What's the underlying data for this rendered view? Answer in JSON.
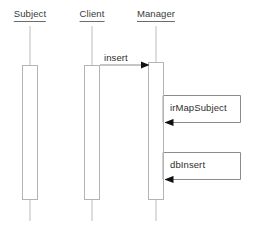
{
  "diagram": {
    "kind": "uml-sequence-diagram",
    "width": 254,
    "height": 228,
    "background_color": "#ffffff",
    "lifeline_color": "#b8b8b8",
    "activation_fill": "#ffffff",
    "activation_stroke": "#b0b0b0",
    "arrow_color": "#6e6e6e",
    "arrowhead_color": "#111111",
    "text_color": "#3a3a3a",
    "participants": [
      {
        "id": "subject",
        "label": "Subject",
        "x": 30,
        "label_y": 12,
        "lifeline_top": 26,
        "lifeline_bottom": 221,
        "activation": {
          "x": 22,
          "y": 65,
          "width": 16,
          "height": 135
        }
      },
      {
        "id": "client",
        "label": "Client",
        "x": 92,
        "label_y": 12,
        "lifeline_top": 26,
        "lifeline_bottom": 221,
        "activation": {
          "x": 84,
          "y": 65,
          "width": 16,
          "height": 135
        }
      },
      {
        "id": "manager",
        "label": "Manager",
        "x": 156,
        "label_y": 12,
        "lifeline_top": 26,
        "lifeline_bottom": 221,
        "activation": {
          "x": 148,
          "y": 62,
          "width": 16,
          "height": 138
        }
      }
    ],
    "messages": [
      {
        "id": "insert",
        "label": "insert",
        "type": "call",
        "from": "client",
        "to": "manager",
        "x1": 100,
        "x2": 150,
        "y": 65,
        "label_x": 104,
        "label_y": 53
      },
      {
        "id": "irMapSubject",
        "label": "irMapSubject",
        "type": "self-call",
        "from": "manager",
        "to": "manager",
        "box": {
          "x": 162,
          "y": 95,
          "width": 78,
          "height": 27
        },
        "out_y": 95,
        "return_y": 122,
        "stem_x": 164,
        "tip_x": 166,
        "label_x": 170,
        "label_y": 103
      },
      {
        "id": "dbInsert",
        "label": "dbInsert",
        "type": "self-call",
        "from": "manager",
        "to": "manager",
        "box": {
          "x": 162,
          "y": 152,
          "width": 78,
          "height": 27
        },
        "out_y": 152,
        "return_y": 180,
        "stem_x": 164,
        "tip_x": 166,
        "label_x": 170,
        "label_y": 160
      }
    ]
  }
}
